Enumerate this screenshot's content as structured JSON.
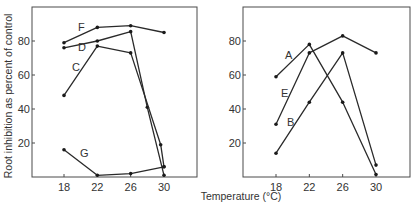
{
  "chart_data": [
    {
      "type": "line",
      "panel": "left",
      "title": "",
      "xlabel": "Temperature (°C)",
      "ylabel": "Root inhibition as percent of control",
      "x_ticks": [
        18,
        22,
        26,
        30
      ],
      "y_ticks": [
        20,
        40,
        60,
        80
      ],
      "xlim": [
        15,
        33
      ],
      "ylim": [
        0,
        100
      ],
      "grid": false,
      "legend": "inline letter labels",
      "series": [
        {
          "name": "F",
          "points": [
            [
              18,
              79
            ],
            [
              22,
              88
            ],
            [
              26,
              89
            ],
            [
              30,
              85
            ]
          ],
          "label_pos": [
            78,
            31
          ]
        },
        {
          "name": "D",
          "points": [
            [
              18,
              76
            ],
            [
              22,
              80
            ],
            [
              26,
              85.5
            ],
            [
              28,
              41
            ],
            [
              30,
              1
            ]
          ],
          "label_pos": [
            78,
            51
          ]
        },
        {
          "name": "C",
          "points": [
            [
              18,
              48
            ],
            [
              22,
              77
            ],
            [
              26,
              73
            ],
            [
              29.6,
              19
            ],
            [
              30,
              6
            ]
          ],
          "label_pos": [
            72,
            71
          ]
        },
        {
          "name": "G",
          "points": [
            [
              18,
              16
            ],
            [
              22,
              1
            ],
            [
              26,
              2
            ],
            [
              30,
              6
            ]
          ],
          "label_pos": [
            80,
            157
          ]
        }
      ]
    },
    {
      "type": "line",
      "panel": "right",
      "title": "",
      "xlabel": "Temperature (°C)",
      "ylabel": "",
      "x_ticks": [
        18,
        22,
        26,
        30
      ],
      "y_ticks": [
        20,
        40,
        60,
        80
      ],
      "xlim": [
        15,
        33
      ],
      "ylim": [
        0,
        100
      ],
      "grid": false,
      "legend": "inline letter labels",
      "series": [
        {
          "name": "A",
          "points": [
            [
              18,
              59
            ],
            [
              22,
              78
            ],
            [
              26,
              44
            ],
            [
              30,
              1.5
            ]
          ],
          "label_pos": [
            285,
            59
          ]
        },
        {
          "name": "E",
          "points": [
            [
              18,
              31
            ],
            [
              22,
              73
            ],
            [
              26,
              83
            ],
            [
              30,
              73
            ]
          ],
          "label_pos": [
            281,
            97
          ]
        },
        {
          "name": "B",
          "points": [
            [
              18,
              14
            ],
            [
              22,
              44
            ],
            [
              26,
              73
            ],
            [
              30,
              7
            ]
          ],
          "label_pos": [
            287,
            126
          ]
        }
      ]
    }
  ],
  "figure": {
    "ylabel": "Root inhibition as percent of control",
    "xlabel": "Temperature (°C)",
    "tick_labels_x": [
      "18",
      "22",
      "26",
      "30"
    ],
    "tick_labels_y": [
      "20",
      "40",
      "60",
      "80"
    ],
    "line_color": "#2a2a2a",
    "axis_color": "#4a4a4a"
  }
}
